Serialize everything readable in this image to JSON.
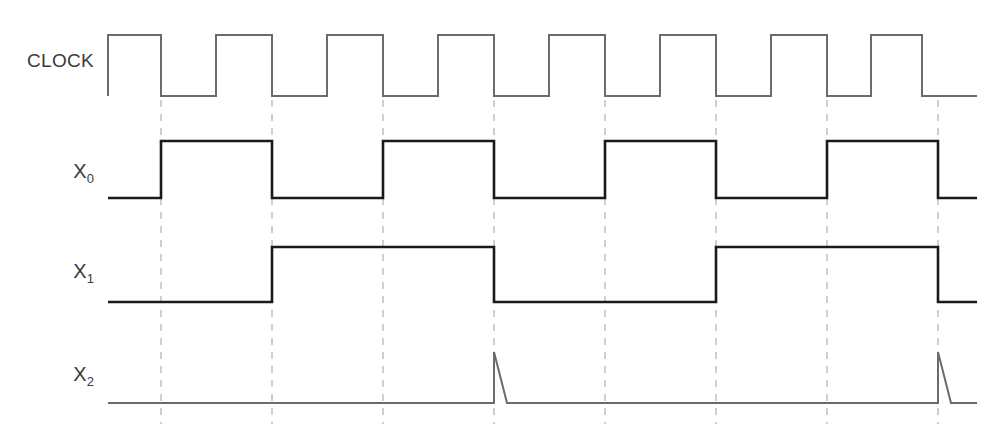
{
  "figure": {
    "type": "digital-timing-diagram",
    "width": 997,
    "height": 432,
    "background_color": "#ffffff"
  },
  "labels": {
    "clock": "CLOCK",
    "x0_base": "X",
    "x0_sub": "0",
    "x1_base": "X",
    "x1_sub": "1",
    "x2_base": "X",
    "x2_sub": "2"
  },
  "colors": {
    "clock_trace": "#6b6b6b",
    "signal_trace": "#1a1a1a",
    "spike_trace": "#6b6b6b",
    "gridline": "#b0b0b0",
    "label_text": "#3a3a3a"
  },
  "geometry": {
    "trace_start_x": 108,
    "trace_end_x": 977,
    "clock_high_y": 35,
    "clock_low_y": 96,
    "x0_high_y": 141,
    "x0_low_y": 198,
    "x1_high_y": 247,
    "x1_low_y": 302,
    "x2_base_y": 403,
    "x2_peak_y": 352,
    "gridline_top_y": 100,
    "gridline_bottom_y": 424,
    "clock_stroke_width": 2,
    "signal_stroke_width": 2.6,
    "spike_stroke_width": 2,
    "gridline_dash": "7 7"
  },
  "chart_data": {
    "type": "line",
    "title": "",
    "xlabel": "",
    "ylabel": "",
    "time_unit": "clock half-period (px)",
    "clock_period_px": 111,
    "clock_high_width_px": 53,
    "clock_edges_x": [
      108,
      161,
      216,
      272,
      327,
      383,
      438,
      494,
      549,
      605,
      660,
      716,
      771,
      827,
      871,
      922
    ],
    "clock_pulse_count": 8,
    "gridlines_x": [
      161,
      272,
      383,
      494,
      605,
      716,
      827,
      938
    ],
    "series": [
      {
        "name": "CLOCK",
        "kind": "square",
        "level_start": 0,
        "transitions_x": [
          108,
          161,
          216,
          272,
          327,
          383,
          438,
          494,
          549,
          605,
          660,
          716,
          771,
          827,
          871,
          922
        ],
        "values": [
          0,
          1,
          0,
          1,
          0,
          1,
          0,
          1,
          0,
          1,
          0,
          1,
          0,
          1,
          0,
          1,
          0
        ]
      },
      {
        "name": "X0",
        "kind": "square",
        "level_start": 0,
        "transitions_x": [
          161,
          272,
          383,
          494,
          605,
          716,
          827,
          938
        ],
        "values": [
          0,
          1,
          0,
          1,
          0,
          1,
          0,
          1,
          0
        ]
      },
      {
        "name": "X1",
        "kind": "square",
        "level_start": 0,
        "transitions_x": [
          272,
          494,
          716,
          938
        ],
        "values": [
          0,
          1,
          0,
          1,
          0
        ]
      },
      {
        "name": "X2",
        "kind": "pulse-decay",
        "level_start": 0,
        "spikes_x": [
          494,
          938
        ],
        "spike_decay_px": 13,
        "values": [
          0,
          1,
          0,
          1,
          0
        ]
      }
    ],
    "legend_position": "left-row-labels",
    "grid": true
  }
}
